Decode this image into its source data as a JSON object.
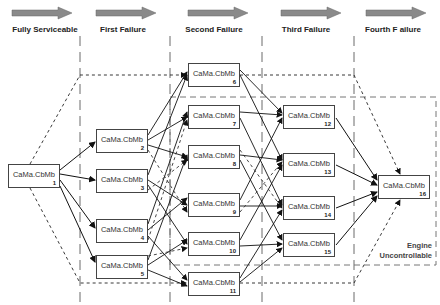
{
  "stages": [
    {
      "label": "Fully Serviceable",
      "x": 0
    },
    {
      "label": "First Failure",
      "x": 85
    },
    {
      "label": "Second Failure",
      "x": 175
    },
    {
      "label": "Third Failure",
      "x": 263
    },
    {
      "label": "Fourth F ailure",
      "x": 350
    }
  ],
  "nodes": [
    {
      "id": 1,
      "label": "CaMa.CbMb",
      "num": "1",
      "x": 8,
      "y": 164
    },
    {
      "id": 2,
      "label": "CaMa.CbMb",
      "num": "2",
      "x": 96,
      "y": 129
    },
    {
      "id": 3,
      "label": "CaMa.CbMb",
      "num": "3",
      "x": 96,
      "y": 169
    },
    {
      "id": 4,
      "label": "CaMa.CbMb",
      "num": "4",
      "x": 96,
      "y": 219
    },
    {
      "id": 5,
      "label": "CaMa.CbMb",
      "num": "5",
      "x": 96,
      "y": 255
    },
    {
      "id": 6,
      "label": "CaMa.CbMb",
      "num": "6",
      "x": 188,
      "y": 63
    },
    {
      "id": 7,
      "label": "CaMa.CbMb",
      "num": "7",
      "x": 188,
      "y": 105
    },
    {
      "id": 8,
      "label": "CaMa.CbMb",
      "num": "8",
      "x": 188,
      "y": 145
    },
    {
      "id": 9,
      "label": "CaMa.CbMb",
      "num": "9",
      "x": 188,
      "y": 193
    },
    {
      "id": 10,
      "label": "CaMa.CbMb",
      "num": "10",
      "x": 188,
      "y": 232
    },
    {
      "id": 11,
      "label": "CaMa.CbMb",
      "num": "11",
      "x": 188,
      "y": 272
    },
    {
      "id": 12,
      "label": "CaMa.CbMb",
      "num": "12",
      "x": 283,
      "y": 105
    },
    {
      "id": 13,
      "label": "CaMa.CbMb",
      "num": "13",
      "x": 283,
      "y": 153
    },
    {
      "id": 14,
      "label": "CaMa.CbMb",
      "num": "14",
      "x": 283,
      "y": 196
    },
    {
      "id": 15,
      "label": "CaMa.CbMb",
      "num": "15",
      "x": 283,
      "y": 233
    },
    {
      "id": 16,
      "label": "CaMa.CbMb",
      "num": "16",
      "x": 378,
      "y": 175
    }
  ],
  "annotation": {
    "line1": "Engine",
    "line2": "Uncontrollable"
  },
  "colors": {
    "arrow_fill": "#888888",
    "line": "#111111",
    "dash": "#777777"
  }
}
